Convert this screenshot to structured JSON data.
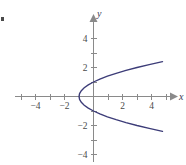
{
  "figure": {
    "width": 186,
    "height": 165,
    "background": "#ffffff",
    "curve_color": "#3c3c78",
    "axis_color": "#8a8a8a",
    "label_color": "#4a4a4a"
  },
  "axes": {
    "x_label": "x",
    "y_label": "y",
    "origin_px": {
      "x": 93,
      "y": 96
    },
    "px_per_unit": 14.5,
    "x_tick_values": [
      -5,
      -4,
      -3,
      -2,
      -1,
      1,
      2,
      3,
      4,
      5
    ],
    "y_tick_values": [
      4,
      3,
      2,
      1,
      -1,
      -2,
      -3,
      -4
    ],
    "x_tick_labels": [
      {
        "value": -4,
        "text": "−4"
      },
      {
        "value": -2,
        "text": "−2"
      },
      {
        "value": 2,
        "text": "2"
      },
      {
        "value": 4,
        "text": "4"
      }
    ],
    "y_tick_labels": [
      {
        "value": 4,
        "text": "4"
      },
      {
        "value": 2,
        "text": "2"
      },
      {
        "value": -2,
        "text": "−2"
      },
      {
        "value": -4,
        "text": "−4"
      }
    ]
  },
  "chart_data": {
    "type": "line",
    "title": "",
    "xlabel": "x",
    "ylabel": "y",
    "xlim": [
      -5.4,
      5.5
    ],
    "ylim": [
      -4.7,
      4.8
    ],
    "grid": false,
    "legend": null,
    "annotations": [],
    "series": [
      {
        "name": "x = y² − 1",
        "equation": "x = y^2 - 1",
        "orientation": "rightward-opening parabola",
        "vertex": [
          -1,
          0
        ],
        "x_intercept": -1,
        "y_intercepts": [
          1,
          -1
        ],
        "color": "#3c3c78",
        "x": [
          4.76,
          3.84,
          3.0,
          2.24,
          1.56,
          0.96,
          0.44,
          0.0,
          -0.36,
          -0.64,
          -0.84,
          -0.96,
          -1.0,
          -0.96,
          -0.84,
          -0.64,
          -0.36,
          0.0,
          0.44,
          0.96,
          1.56,
          2.24,
          3.0,
          3.84,
          4.76
        ],
        "y": [
          2.4,
          2.2,
          2.0,
          1.8,
          1.6,
          1.4,
          1.2,
          1.0,
          0.8,
          0.6,
          0.4,
          0.2,
          0.0,
          -0.2,
          -0.4,
          -0.6,
          -0.8,
          -1.0,
          -1.2,
          -1.4,
          -1.6,
          -1.8,
          -2.0,
          -2.2,
          -2.4
        ]
      }
    ]
  }
}
